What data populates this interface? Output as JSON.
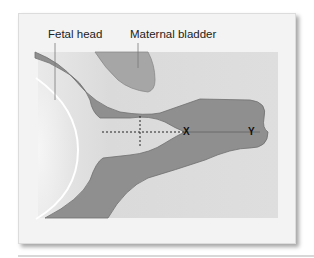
{
  "figure": {
    "labels": {
      "fetal_head": "Fetal head",
      "maternal_bladder": "Maternal bladder"
    },
    "markers": {
      "x": "X",
      "y": "Y"
    },
    "colors": {
      "card_background": "#f3f3f3",
      "inner_background": "#dedede",
      "tissue": "#8e8e8e",
      "tissue_outline": "#6e6e6e",
      "bladder": "#a8a8a8",
      "head_outline": "#ffffff"
    }
  }
}
